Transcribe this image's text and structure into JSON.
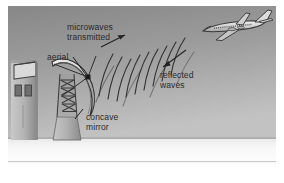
{
  "figure": {
    "labels": {
      "microwaves_line1": "microwaves",
      "microwaves_line2": "transmitted",
      "aerial": "aerial",
      "concave_line1": "concave",
      "concave_line2": "mirror",
      "reflected_line1": "reflected",
      "reflected_line2": "waves"
    },
    "colors": {
      "sky_top": "#8d8d8d",
      "sky_bottom": "#b9b9b9",
      "ground": "#f2f2f2",
      "ground_line": "#9a9a9a",
      "wave_stroke": "#3a3a3a",
      "text": "#2b2b2b",
      "structure_light": "#d6d6d6",
      "structure_mid": "#a9a9a9",
      "structure_dark": "#6e6e6e",
      "frame": "#ffffff",
      "aircraft_body": "#d8d8d8",
      "aircraft_outline": "#444444"
    },
    "objects": {
      "building": "left building with windows",
      "tower": "lattice mast tower",
      "dish": "concave mirror dish antenna",
      "feed": "aerial feed point",
      "aircraft": "airliner",
      "transmitted_arrow": "arrow pointing up-right",
      "reflected_arrow": "arrow pointing down-left",
      "aerial_leader": "leader line to feed point",
      "concave_leader": "leader line to dish"
    },
    "wave_counts": {
      "transmitted_arcs": 9,
      "reflected_arcs": 9
    }
  }
}
